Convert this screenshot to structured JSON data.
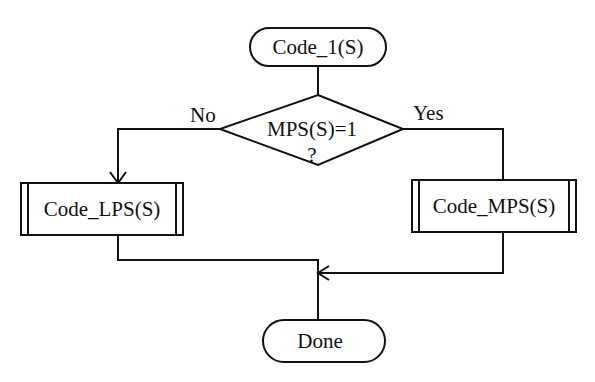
{
  "diagram": {
    "type": "flowchart",
    "colors": {
      "stroke": "#111111",
      "background": "#ffffff",
      "text": "#111111"
    },
    "nodes": {
      "start": {
        "label": "Code_1(S)",
        "shape": "terminator"
      },
      "decision": {
        "line1": "MPS(S)=1",
        "line2": "?",
        "shape": "diamond"
      },
      "lps": {
        "label": "Code_LPS(S)",
        "shape": "predefined-process"
      },
      "mps": {
        "label": "Code_MPS(S)",
        "shape": "predefined-process"
      },
      "done": {
        "label": "Done",
        "shape": "terminator"
      }
    },
    "edges": {
      "no_label": "No",
      "yes_label": "Yes"
    }
  }
}
